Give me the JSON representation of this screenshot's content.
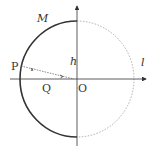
{
  "labels": {
    "M": "M",
    "P": "P",
    "h": "h",
    "l": "l",
    "Q": "Q",
    "O": "O"
  },
  "colors": {
    "stroke": "#333333",
    "dashed": "#888888"
  }
}
